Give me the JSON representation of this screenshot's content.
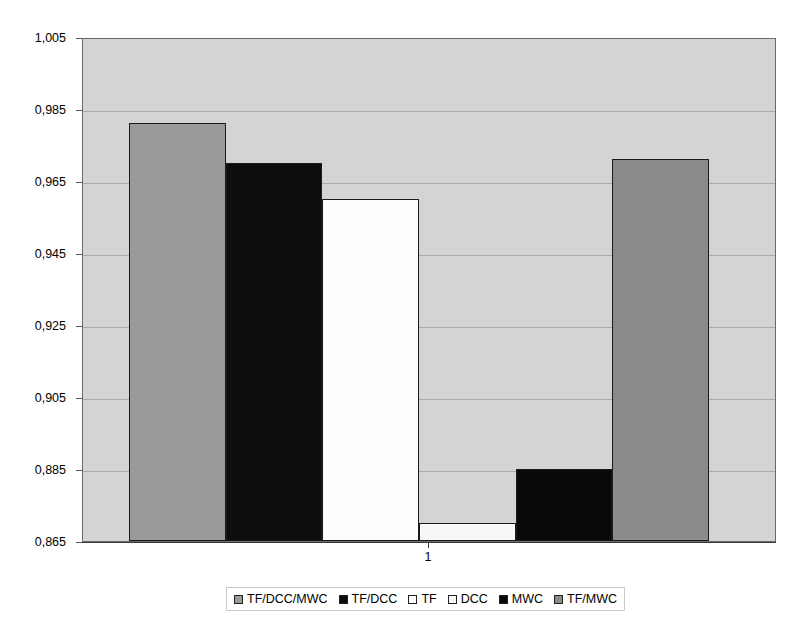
{
  "chart_data": {
    "type": "bar",
    "title": "",
    "subtitle": "",
    "xlabel": "",
    "ylabel": "",
    "categories": [
      "1"
    ],
    "ylim": [
      0.865,
      1.005
    ],
    "ytick_labels": [
      "1,005",
      "0,985",
      "0,965",
      "0,945",
      "0,925",
      "0,905",
      "0,885",
      "0,865"
    ],
    "ytick_values": [
      1.005,
      0.985,
      0.965,
      0.945,
      0.925,
      0.905,
      0.885,
      0.865
    ],
    "grid": true,
    "legend_position": "bottom",
    "decimal_separator": ",",
    "series": [
      {
        "name": "TF/DCC/MWC",
        "values": [
          0.981
        ],
        "color": "#9a9a9a"
      },
      {
        "name": "TF/DCC",
        "values": [
          0.97
        ],
        "color": "#0d0d0d"
      },
      {
        "name": "TF",
        "values": [
          0.96
        ],
        "color": "#fdfdfd"
      },
      {
        "name": "DCC",
        "values": [
          0.87
        ],
        "color": "#f7f7f7"
      },
      {
        "name": "MWC",
        "values": [
          0.885
        ],
        "color": "#080808"
      },
      {
        "name": "TF/MWC",
        "values": [
          0.971
        ],
        "color": "#8b8b8b"
      }
    ],
    "plot_background": "#d4d4d4",
    "page_background": "#ffffff",
    "bar_border_color": "#1a1a1a"
  }
}
